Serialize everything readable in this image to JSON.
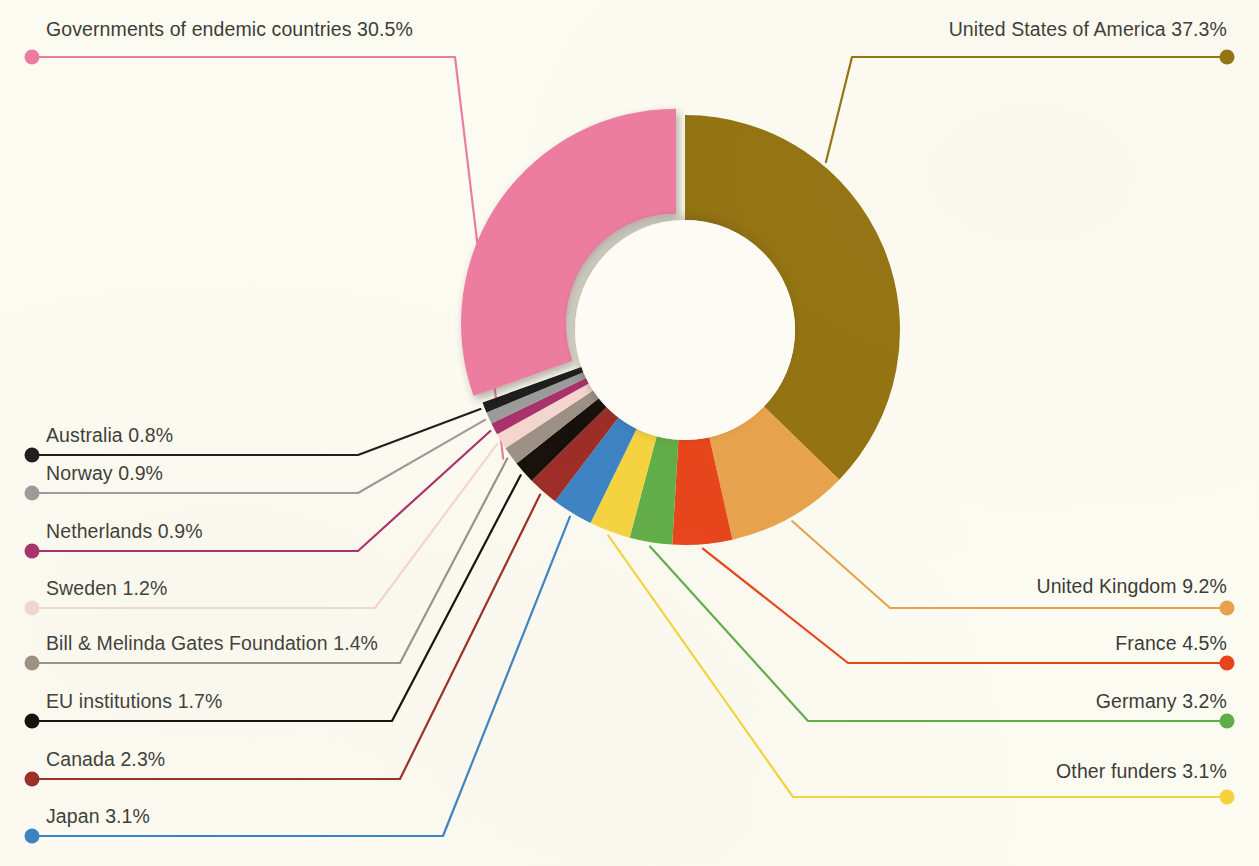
{
  "background_color": "#fcfbf2",
  "text_color": "#3e3c38",
  "chart_data": {
    "type": "pie",
    "variant": "donut",
    "title": "",
    "subtitle": "",
    "xlabel": "",
    "ylabel": "",
    "units": "percent",
    "legend_position": "callout-labels",
    "grid": false,
    "center_x": 685,
    "center_y": 330,
    "outer_radius": 215,
    "inner_radius": 110,
    "start_angle_deg": -90,
    "total_percent": 100.1,
    "categories": [
      "United States of America",
      "United Kingdom",
      "France",
      "Germany",
      "Other funders",
      "Japan",
      "Canada",
      "EU institutions",
      "Bill & Melinda Gates Foundation",
      "Sweden",
      "Netherlands",
      "Norway",
      "Australia",
      "Governments of endemic countries"
    ],
    "values": [
      37.3,
      9.2,
      4.5,
      3.2,
      3.1,
      3.1,
      2.3,
      1.7,
      1.4,
      1.2,
      0.9,
      0.9,
      0.8,
      30.5
    ],
    "colors": [
      "#937210",
      "#e8a24c",
      "#e8431a",
      "#5fad46",
      "#f5d33e",
      "#3a82c4",
      "#9c2b24",
      "#140d08",
      "#9c9084",
      "#f5d6ce",
      "#a8306a",
      "#9a9a9a",
      "#1c1c1c",
      "#ec7ca0"
    ],
    "exploded": [
      "Governments of endemic countries"
    ]
  },
  "slices": [
    {
      "id": "usa",
      "label": "United States of America",
      "value": 37.3,
      "value_text": "37.3%",
      "full_text": "United States of America 37.3%",
      "color": "#937210",
      "side": "right"
    },
    {
      "id": "uk",
      "label": "United Kingdom",
      "value": 9.2,
      "value_text": "9.2%",
      "full_text": "United Kingdom  9.2%",
      "color": "#e8a24c",
      "side": "right"
    },
    {
      "id": "france",
      "label": "France",
      "value": 4.5,
      "value_text": "4.5%",
      "full_text": "France  4.5%",
      "color": "#e8431a",
      "side": "right"
    },
    {
      "id": "germany",
      "label": "Germany",
      "value": 3.2,
      "value_text": "3.2%",
      "full_text": "Germany  3.2%",
      "color": "#5fad46",
      "side": "right"
    },
    {
      "id": "other-funders",
      "label": "Other funders",
      "value": 3.1,
      "value_text": "3.1%",
      "full_text": "Other funders  3.1%",
      "color": "#f5d33e",
      "side": "right"
    },
    {
      "id": "japan",
      "label": "Japan",
      "value": 3.1,
      "value_text": "3.1%",
      "full_text": "Japan  3.1%",
      "color": "#3a82c4",
      "side": "left"
    },
    {
      "id": "canada",
      "label": "Canada",
      "value": 2.3,
      "value_text": "2.3%",
      "full_text": "Canada  2.3%",
      "color": "#9c2b24",
      "side": "left"
    },
    {
      "id": "eu-institutions",
      "label": "EU institutions",
      "value": 1.7,
      "value_text": "1.7%",
      "full_text": "EU institutions  1.7%",
      "color": "#140d08",
      "side": "left"
    },
    {
      "id": "gates-foundation",
      "label": "Bill & Melinda Gates Foundation",
      "value": 1.4,
      "value_text": "1.4%",
      "full_text": "Bill & Melinda Gates Foundation  1.4%",
      "color": "#9c9084",
      "side": "left"
    },
    {
      "id": "sweden",
      "label": "Sweden",
      "value": 1.2,
      "value_text": "1.2%",
      "full_text": "Sweden  1.2%",
      "color": "#f5d6ce",
      "side": "left"
    },
    {
      "id": "netherlands",
      "label": "Netherlands",
      "value": 0.9,
      "value_text": "0.9%",
      "full_text": "Netherlands  0.9%",
      "color": "#a8306a",
      "side": "left"
    },
    {
      "id": "norway",
      "label": "Norway",
      "value": 0.9,
      "value_text": "0.9%",
      "full_text": "Norway  0.9%",
      "color": "#9a9a9a",
      "side": "left"
    },
    {
      "id": "australia",
      "label": "Australia",
      "value": 0.8,
      "value_text": "0.8%",
      "full_text": "Australia  0.8%",
      "color": "#1c1c1c",
      "side": "left"
    },
    {
      "id": "endemic-governments",
      "label": "Governments of endemic countries",
      "value": 30.5,
      "value_text": "30.5%",
      "full_text": "Governments of endemic countries 30.5%",
      "color": "#ec7ca0",
      "side": "left-top"
    }
  ]
}
